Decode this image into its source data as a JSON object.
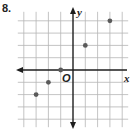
{
  "problem": {
    "number": "8."
  },
  "chart_data": {
    "type": "scatter",
    "title": "",
    "xlabel": "x",
    "ylabel": "y",
    "origin_label": "O",
    "xlim": [
      -4,
      4
    ],
    "ylim": [
      -4,
      4
    ],
    "grid": true,
    "tick_labels": false,
    "points": [
      {
        "x": -3,
        "y": -2
      },
      {
        "x": -2,
        "y": -1
      },
      {
        "x": -1,
        "y": 0
      },
      {
        "x": 1,
        "y": 2
      },
      {
        "x": 3,
        "y": 4
      }
    ],
    "colors": {
      "grid": "#b5b5b5",
      "axis": "#1e1e1e",
      "point": "#5a5a5a"
    }
  }
}
